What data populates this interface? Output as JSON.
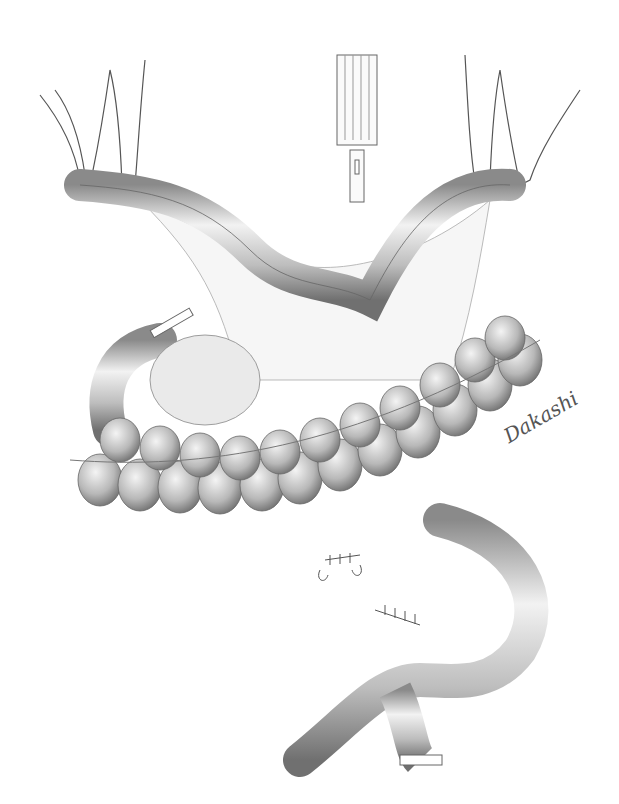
{
  "illustration": {
    "subject": "surgical-illustration-bowel-anastomosis",
    "signature": "Dakashi",
    "colors": {
      "background": "#ffffff",
      "ink": "#555555",
      "shade": "#bdbdbd",
      "highlight": "#eeeeee"
    }
  }
}
